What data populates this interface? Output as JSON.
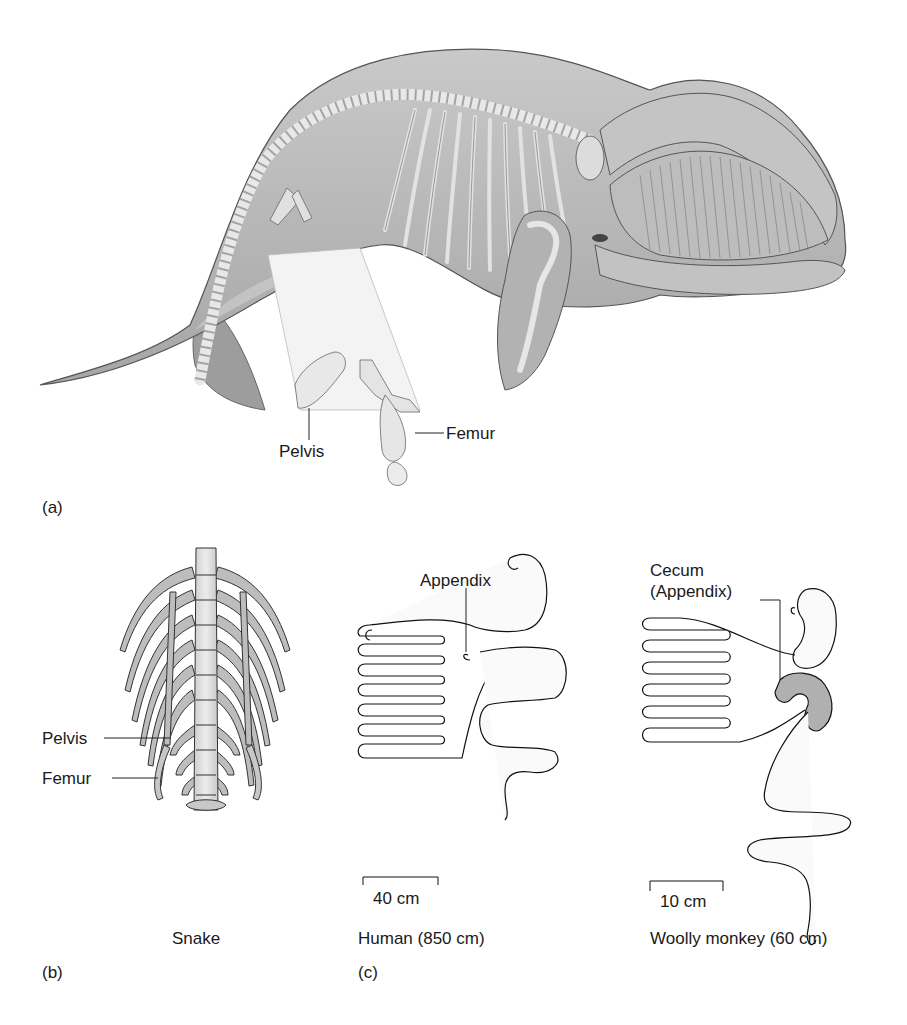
{
  "figure": {
    "panels": [
      {
        "id": "a",
        "panel_label": "(a)",
        "subject": "Whale",
        "callouts": [
          "Pelvis",
          "Femur"
        ]
      },
      {
        "id": "b",
        "panel_label": "(b)",
        "caption": "Snake",
        "callouts": [
          "Pelvis",
          "Femur"
        ]
      },
      {
        "id": "c",
        "panel_label": "(c)",
        "diagrams": [
          {
            "caption": "Human (850 cm)",
            "scale_bar": "40 cm",
            "callout": "Appendix"
          },
          {
            "caption": "Woolly monkey (60 cm)",
            "scale_bar": "10 cm",
            "callout_line1": "Cecum",
            "callout_line2": "(Appendix)"
          }
        ]
      }
    ]
  },
  "colors": {
    "body_gray": "#b9b9b9",
    "bone": "#e6e6e6",
    "line": "#333333",
    "cecum_fill": "#b0b0b0"
  }
}
